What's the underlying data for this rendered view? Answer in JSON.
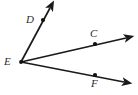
{
  "figure": {
    "type": "geometry-diagram",
    "background_color": "#ffffff",
    "stroke_color": "#1a1a1a",
    "label_color": "#2b2b2b",
    "width": 138,
    "height": 95
  },
  "vertex": {
    "name": "E",
    "label": "E",
    "x": 21,
    "y": 62,
    "label_x": 4,
    "label_y": 56
  },
  "rays": [
    {
      "id": "ray-ED",
      "label": "D",
      "from": "E",
      "through_point": "D",
      "start_x": 21,
      "start_y": 62,
      "end_x": 52,
      "end_y": 5,
      "dot_x": 43,
      "dot_y": 20,
      "label_x": 26,
      "label_y": 14,
      "direction": "upper-left-diagonal"
    },
    {
      "id": "ray-EC",
      "label": "C",
      "from": "E",
      "through_point": "C",
      "start_x": 21,
      "start_y": 62,
      "end_x": 131,
      "end_y": 37,
      "dot_x": 95,
      "dot_y": 44,
      "label_x": 90,
      "label_y": 28,
      "direction": "upper-right"
    },
    {
      "id": "ray-EF",
      "label": "F",
      "from": "E",
      "through_point": "F",
      "start_x": 21,
      "start_y": 62,
      "end_x": 129,
      "end_y": 83,
      "dot_x": 95,
      "dot_y": 75,
      "label_x": 91,
      "label_y": 78,
      "direction": "lower-right"
    }
  ]
}
